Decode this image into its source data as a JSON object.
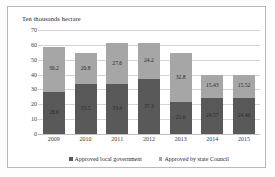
{
  "chart_data": {
    "type": "bar",
    "stacked": true,
    "title": "",
    "xlabel": "",
    "ylabel": "Ten thousands hectare",
    "ylim": [
      0,
      70
    ],
    "yticks": [
      "0",
      "10",
      "20",
      "30",
      "40",
      "50",
      "60",
      "70"
    ],
    "grid": true,
    "legend_position": "bottom",
    "categories": [
      "2009",
      "2010",
      "2011",
      "2012",
      "2013",
      "2014",
      "2015"
    ],
    "series": [
      {
        "name": "Approved local government",
        "color": "#595959",
        "values": [
          28.6,
          33.5,
          33.4,
          37.3,
          21.6,
          24.57,
          24.46
        ],
        "labels": [
          "28.6",
          "33.5",
          "33.4",
          "37.3",
          "21.6",
          "24.57",
          "24.46"
        ]
      },
      {
        "name": "Approved by state Council",
        "color": "#a6a6a6",
        "values": [
          30.2,
          20.8,
          27.6,
          24.2,
          32.8,
          15.43,
          15.52
        ],
        "labels": [
          "30.2",
          "20.8",
          "27.6",
          "24.2",
          "32.8",
          "15.43",
          "15.52"
        ]
      }
    ],
    "totals": [
      58.8,
      54.3,
      61.0,
      61.5,
      54.4,
      40.0,
      39.98
    ]
  }
}
